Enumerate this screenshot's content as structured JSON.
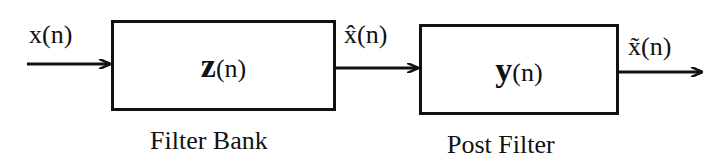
{
  "diagram": {
    "type": "block-diagram",
    "blocks": [
      {
        "id": "filter-bank",
        "symbol": "z",
        "arg": "(n)",
        "caption": "Filter Bank"
      },
      {
        "id": "post-filter",
        "symbol": "y",
        "arg": "(n)",
        "caption": "Post Filter"
      }
    ],
    "signals": [
      {
        "label": "x(n)",
        "from": "input",
        "to": "filter-bank"
      },
      {
        "label": "x̂(n)",
        "from": "filter-bank",
        "to": "post-filter"
      },
      {
        "label": "x̃(n)",
        "from": "post-filter",
        "to": "output"
      }
    ]
  }
}
